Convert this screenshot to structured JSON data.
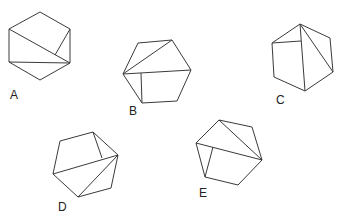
{
  "figure": {
    "stroke_color": "#3a3a3a",
    "shapes": [
      {
        "label": "A",
        "label_pos": [
          10,
          99
        ],
        "outline": [
          [
            40,
            12
          ],
          [
            70,
            29
          ],
          [
            70,
            63
          ],
          [
            40,
            80
          ],
          [
            9,
            62
          ],
          [
            9,
            29
          ]
        ],
        "lines": [
          [
            [
              9,
              29
            ],
            [
              70,
              63
            ]
          ],
          [
            [
              9,
              62
            ],
            [
              70,
              63
            ]
          ],
          [
            [
              55,
              55
            ],
            [
              70,
              29
            ]
          ]
        ]
      },
      {
        "label": "B",
        "label_pos": [
          129,
          115
        ],
        "outline": [
          [
            138,
            43
          ],
          [
            172,
            40
          ],
          [
            191,
            70
          ],
          [
            177,
            101
          ],
          [
            142,
            103
          ],
          [
            123,
            74
          ]
        ],
        "lines": [
          [
            [
              123,
              74
            ],
            [
              172,
              40
            ]
          ],
          [
            [
              123,
              74
            ],
            [
              191,
              70
            ]
          ],
          [
            [
              141,
              73
            ],
            [
              142,
              103
            ]
          ]
        ]
      },
      {
        "label": "C",
        "label_pos": [
          276,
          104
        ],
        "outline": [
          [
            300,
            24
          ],
          [
            330,
            38
          ],
          [
            333,
            72
          ],
          [
            305,
            91
          ],
          [
            274,
            77
          ],
          [
            272,
            43
          ]
        ],
        "lines": [
          [
            [
              300,
              24
            ],
            [
              305,
              91
            ]
          ],
          [
            [
              300,
              24
            ],
            [
              333,
              72
            ]
          ],
          [
            [
              272,
              43
            ],
            [
              301,
              41
            ]
          ]
        ]
      },
      {
        "label": "D",
        "label_pos": [
          58,
          211
        ],
        "outline": [
          [
            60,
            141
          ],
          [
            93,
            132
          ],
          [
            118,
            155
          ],
          [
            111,
            188
          ],
          [
            78,
            197
          ],
          [
            53,
            174
          ]
        ],
        "lines": [
          [
            [
              53,
              174
            ],
            [
              118,
              155
            ]
          ],
          [
            [
              78,
              197
            ],
            [
              118,
              155
            ]
          ],
          [
            [
              93,
              132
            ],
            [
              102,
              158
            ]
          ]
        ]
      },
      {
        "label": "E",
        "label_pos": [
          199,
          197
        ],
        "outline": [
          [
            219,
            120
          ],
          [
            252,
            127
          ],
          [
            262,
            160
          ],
          [
            238,
            185
          ],
          [
            205,
            177
          ],
          [
            196,
            143
          ]
        ],
        "lines": [
          [
            [
              219,
              120
            ],
            [
              262,
              160
            ]
          ],
          [
            [
              196,
              143
            ],
            [
              262,
              160
            ]
          ],
          [
            [
              213,
              147
            ],
            [
              205,
              177
            ]
          ]
        ]
      }
    ]
  }
}
